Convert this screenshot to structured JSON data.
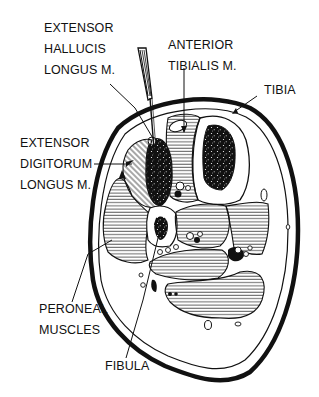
{
  "diagram": {
    "type": "anatomical cross-section",
    "colors": {
      "ink": "#111111",
      "background": "#ffffff",
      "hatch": "#222222"
    }
  },
  "labels": {
    "ehl": {
      "lines": [
        "EXTENSOR",
        "HALLUCIS",
        "LONGUS M."
      ]
    },
    "ata": {
      "lines": [
        "ANTERIOR",
        "TIBIALIS M."
      ]
    },
    "tibia": {
      "lines": [
        "TIBIA"
      ]
    },
    "edl": {
      "lines": [
        "EXTENSOR",
        "DIGITORUM",
        "LONGUS M."
      ]
    },
    "peroneal": {
      "lines": [
        "PERONEAL",
        "MUSCLES"
      ]
    },
    "fibula": {
      "lines": [
        "FIBULA"
      ]
    }
  },
  "instrument": {
    "name": "needle electrode"
  }
}
